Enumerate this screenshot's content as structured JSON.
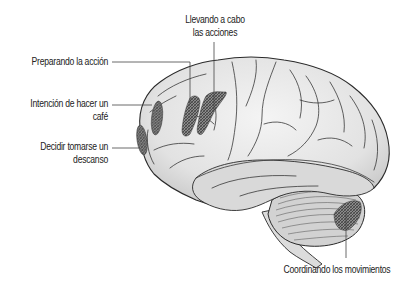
{
  "diagram": {
    "labels": [
      {
        "id": "llevando",
        "line1": "Llevando a cabo",
        "line2": "las acciones"
      },
      {
        "id": "preparando",
        "line1": "Preparando la acción"
      },
      {
        "id": "intencion",
        "line1": "Intención de hacer un",
        "line2": "café"
      },
      {
        "id": "decidir",
        "line1": "Decidir tomarse un",
        "line2": "descanso"
      },
      {
        "id": "coordinando",
        "line1": "Coordinando los movimientos"
      }
    ],
    "colors": {
      "outline": "#2a2a2a",
      "fill": "#e6e6e6",
      "shade": "#c9c9c9",
      "hatch": "#555555",
      "leader": "#444444",
      "text": "#222222"
    }
  }
}
